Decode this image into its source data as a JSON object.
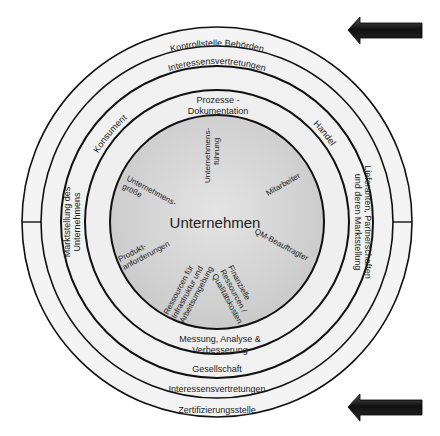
{
  "diagram": {
    "center_label": "Unternehmen",
    "outer_ring_top": "Kontrollstelle Behörden",
    "outer_ring_bottom": "Zertifizierungsstelle",
    "ring2_top": "Interessensvertretungen",
    "ring2_bottom": "Interessensvertretungen",
    "ring3_top_left": "Konsument",
    "ring3_top_right": "Handel",
    "ring3_bottom": "Gesellschaft",
    "ring3_left": [
      "Marktstellung des",
      "Unternehmens"
    ],
    "ring3_right": [
      "Lieferanten, Partnerschaften",
      "und deren Marktstellung"
    ],
    "ring4_top": [
      "Prozesse -",
      "Dokumentation"
    ],
    "ring4_bottom": [
      "Messung, Analyse &",
      "Verbesserung"
    ],
    "core_spokes": [
      {
        "lines": [
          "Unternehmens-",
          "führung"
        ]
      },
      {
        "lines": [
          "Mitarbeiter"
        ]
      },
      {
        "lines": [
          "QM-Beauftragter"
        ]
      },
      {
        "lines": [
          "Finanzielle",
          "Ressourcen /",
          "Qualitätskosten"
        ]
      },
      {
        "lines": [
          "Ressourcen für",
          "Infrastruktur und",
          "Arbeitsumgebung"
        ]
      },
      {
        "lines": [
          "Produkt-",
          "anforderungen"
        ]
      },
      {
        "lines": [
          "Unternehmens-",
          "größe"
        ]
      }
    ],
    "arrows": [
      "top-right-arrow",
      "bottom-right-arrow"
    ],
    "colors": {
      "ring_fill": "#f2f2f2",
      "core_fill": "#d6d6d6",
      "stroke": "#111111",
      "arrow": "#1a1a1a"
    }
  }
}
